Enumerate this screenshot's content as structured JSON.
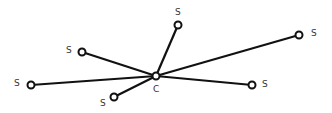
{
  "diagram": {
    "type": "star-network",
    "colors": {
      "edge": "#111111",
      "node_fill": "#ffffff",
      "node_stroke": "#111111",
      "label": "#333333"
    },
    "center": {
      "label": "C",
      "x": 156,
      "y": 76,
      "label_x": 153,
      "label_y": 92
    },
    "nodes": [
      {
        "label": "S",
        "x": 178,
        "y": 25,
        "label_x": 175,
        "label_y": 15
      },
      {
        "label": "S",
        "x": 299,
        "y": 35,
        "label_x": 311,
        "label_y": 36
      },
      {
        "label": "S",
        "x": 82,
        "y": 52,
        "label_x": 66,
        "label_y": 53
      },
      {
        "label": "S",
        "x": 31,
        "y": 85,
        "label_x": 14,
        "label_y": 86
      },
      {
        "label": "S",
        "x": 114,
        "y": 97,
        "label_x": 100,
        "label_y": 106
      },
      {
        "label": "S",
        "x": 252,
        "y": 85,
        "label_x": 262,
        "label_y": 87
      }
    ]
  }
}
